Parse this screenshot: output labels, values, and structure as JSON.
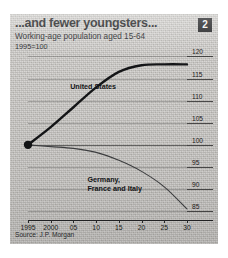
{
  "header": {
    "title": "...and fewer youngsters...",
    "badge": "2",
    "subtitle": "Working-age population aged 15-64",
    "basis": "1995=100"
  },
  "source_note": "Source: J.P. Morgan",
  "colors": {
    "background": "#c8c6c2",
    "ink": "#1b1c1e",
    "us_line": "#141517",
    "europe_line": "#3a3b3d",
    "badge_bg": "#1b1c1e",
    "badge_text": "#f2f1ee"
  },
  "chart_data": {
    "type": "line",
    "title": "...and fewer youngsters...",
    "subtitle": "Working-age population aged 15-64",
    "units": "1995=100",
    "xlabel": "",
    "ylabel": "",
    "xlim": [
      1995,
      2030
    ],
    "ylim": [
      83,
      121
    ],
    "yticks": [
      120,
      115,
      110,
      105,
      100,
      95,
      90,
      85
    ],
    "ytick_labels": [
      "120",
      "115",
      "110",
      "105",
      "100",
      "95",
      "90",
      "85"
    ],
    "y_axis_position": "right",
    "xticks": [
      1995,
      2000,
      2005,
      2010,
      2015,
      2020,
      2025,
      2030
    ],
    "xtick_labels": [
      "1995",
      "2000",
      "05",
      "10",
      "15",
      "20",
      "25",
      "30"
    ],
    "grid": true,
    "legend": "inline-annotations",
    "marker_point": {
      "x": 1995,
      "y": 100,
      "style": "filled-circle"
    },
    "series": [
      {
        "name": "United States",
        "label_position": {
          "x": 2010,
          "y": 113
        },
        "x": [
          1995,
          2000,
          2005,
          2010,
          2015,
          2020,
          2025,
          2030
        ],
        "values": [
          100,
          104,
          108.5,
          113,
          116.5,
          118,
          118.2,
          118.2
        ]
      },
      {
        "name": "Germany, France and Italy",
        "label_position": {
          "x": 2016,
          "y": 92
        },
        "x": [
          1995,
          2000,
          2005,
          2010,
          2015,
          2020,
          2025,
          2030
        ],
        "values": [
          100,
          99.6,
          99.2,
          98.3,
          96.5,
          94,
          90.5,
          85.5
        ]
      }
    ],
    "annotations": [
      {
        "text": "United States",
        "x": 2010,
        "y": 113
      },
      {
        "text": "Germany,",
        "x": 2016,
        "y": 93
      },
      {
        "text": "France and Italy",
        "x": 2016,
        "y": 91
      }
    ]
  }
}
